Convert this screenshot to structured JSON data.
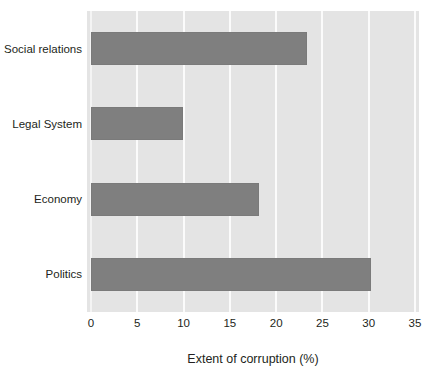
{
  "chart_data": {
    "type": "bar",
    "orientation": "horizontal",
    "title": "",
    "xlabel": "Extent of corruption (%)",
    "ylabel": "",
    "categories": [
      "Politics",
      "Economy",
      "Legal System",
      "Social relations"
    ],
    "values": [
      30.2,
      18.2,
      9.9,
      23.3
    ],
    "series": [
      {
        "name": "Extent of corruption (%)",
        "values": [
          30.2,
          18.2,
          9.9,
          23.3
        ]
      }
    ],
    "xlim": [
      0,
      35
    ],
    "xticks": [
      0,
      5,
      10,
      15,
      20,
      25,
      30,
      35
    ],
    "xtick_labels": [
      "0",
      "5",
      "10",
      "15",
      "20",
      "25",
      "30",
      "35"
    ],
    "grid": "vertical",
    "legend": "none",
    "colors": {
      "bar": "#7f7f7f",
      "plot_background": "#e4e4e4",
      "gridline": "#fbfbfb",
      "text": "#231f20",
      "page_background": "#ffffff"
    }
  },
  "title_remnant": "",
  "axis": {
    "x_title": "Extent of corruption (%)"
  }
}
